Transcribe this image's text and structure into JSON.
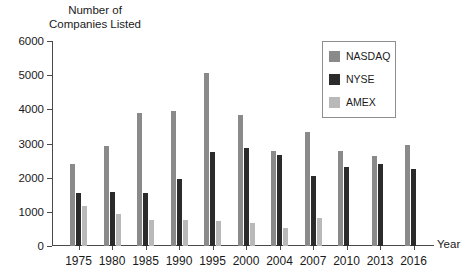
{
  "chart_data": {
    "type": "bar",
    "title": "",
    "ylabel": "Number of\nCompanies Listed",
    "xlabel": "Year",
    "ylim": [
      0,
      6000
    ],
    "yticks": [
      0,
      1000,
      2000,
      3000,
      4000,
      5000,
      6000
    ],
    "ytick_labels": [
      "0",
      "1000",
      "2000",
      "3000",
      "4000",
      "5000",
      "6000"
    ],
    "grid": false,
    "legend_position": "top-right",
    "categories": [
      "1975",
      "1980",
      "1985",
      "1990",
      "1995",
      "2000",
      "2004",
      "2007",
      "2010",
      "2013",
      "2016"
    ],
    "series": [
      {
        "name": "NASDAQ",
        "color": "#8a8a8a",
        "values": [
          2400,
          2930,
          3880,
          3950,
          5050,
          3840,
          2780,
          3330,
          2780,
          2630,
          2950
        ]
      },
      {
        "name": "NYSE",
        "color": "#2b2b2b",
        "values": [
          1560,
          1580,
          1540,
          1960,
          2750,
          2870,
          2650,
          2050,
          2300,
          2410,
          2260
        ]
      },
      {
        "name": "AMEX",
        "color": "#b9b9b9",
        "values": [
          1180,
          940,
          750,
          750,
          720,
          680,
          520,
          820,
          null,
          null,
          null
        ]
      }
    ]
  },
  "legend": {
    "entries": [
      {
        "label": "NASDAQ",
        "color": "#8a8a8a"
      },
      {
        "label": "NYSE",
        "color": "#2b2b2b"
      },
      {
        "label": "AMEX",
        "color": "#b9b9b9"
      }
    ]
  },
  "axes": {
    "y_title": "Number of\nCompanies Listed",
    "x_title": "Year"
  }
}
